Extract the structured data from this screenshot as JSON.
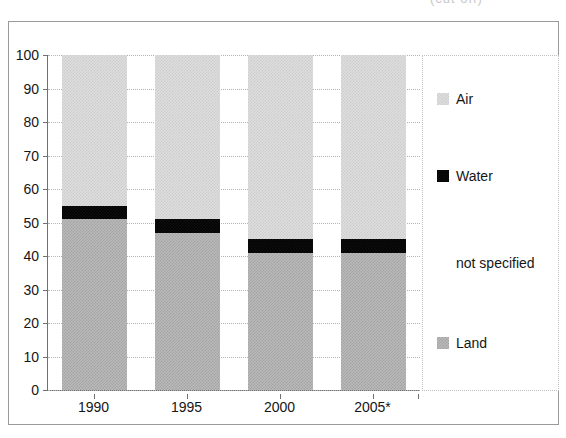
{
  "caption_fragment": "(cut off)",
  "chart_data": {
    "type": "bar",
    "subtype": "stacked-100-percent",
    "title": "",
    "subtitle": "",
    "xlabel": "",
    "ylabel": "",
    "categories": [
      "1990",
      "1995",
      "2000",
      "2005*"
    ],
    "series": [
      {
        "name": "Land",
        "values": [
          51,
          47,
          41,
          41
        ],
        "color": "#b9b9b9",
        "pattern": "dotted-gray"
      },
      {
        "name": "Water",
        "values": [
          4,
          4,
          4,
          4
        ],
        "color": "#0d0d0d",
        "pattern": "solid-black"
      },
      {
        "name": "not specified",
        "values": [
          0,
          0,
          0,
          0
        ],
        "color": "#ffffff",
        "pattern": "blank"
      },
      {
        "name": "Air",
        "values": [
          45,
          49,
          55,
          55
        ],
        "color": "#dedede",
        "pattern": "dotted-light"
      }
    ],
    "stack_order_bottom_to_top": [
      "Land",
      "Water",
      "not specified",
      "Air"
    ],
    "ylim": [
      0,
      100
    ],
    "ytick_step": 10,
    "yticks": [
      "100",
      "90",
      "80",
      "70",
      "60",
      "50",
      "40",
      "30",
      "20",
      "10",
      "0"
    ],
    "xticks": [
      "1990",
      "1995",
      "2000",
      "2005*"
    ],
    "grid": "horizontal-dotted",
    "legend_position": "right",
    "legend_entries": [
      {
        "label": "Air",
        "swatch": "fill-air",
        "y_percent": 13
      },
      {
        "label": "Water",
        "swatch": "fill-water",
        "y_percent": 36
      },
      {
        "label": "not specified",
        "swatch": "fill-notspecified",
        "y_percent": 62
      },
      {
        "label": "Land",
        "swatch": "fill-land",
        "y_percent": 86
      }
    ]
  }
}
